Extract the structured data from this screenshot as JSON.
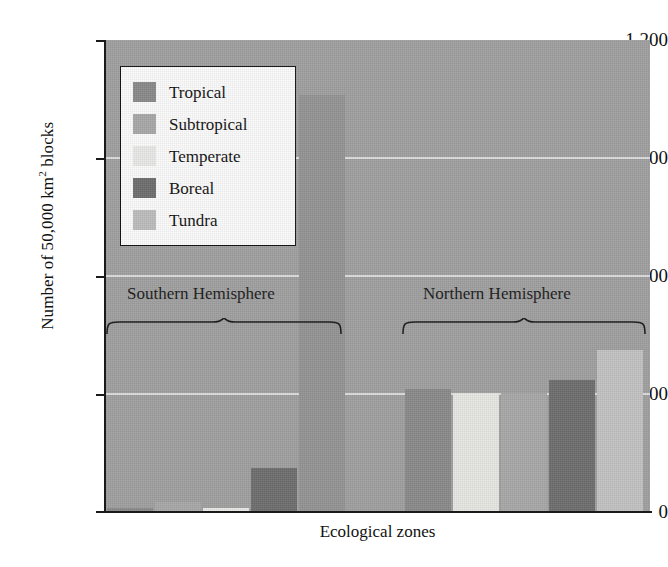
{
  "chart_data": {
    "type": "bar",
    "title": "",
    "xlabel": "Ecological zones",
    "ylabel": "Number of 50,000 km2 blocks",
    "ylabel_parts": {
      "pre": "Number of 50,000 km",
      "sup": "2",
      "post": " blocks"
    },
    "ylim": [
      0,
      1200
    ],
    "yticks": [
      0,
      300,
      600,
      900,
      1200
    ],
    "ytick_labels": [
      "0",
      "300",
      "600",
      "900",
      "1,200"
    ],
    "grid": "horizontal",
    "legend_position": "upper-left-inside",
    "categories": [
      "Tropical",
      "Subtropical",
      "Temperate",
      "Boreal",
      "Tundra"
    ],
    "groups": [
      "Southern Hemisphere",
      "Northern Hemisphere"
    ],
    "series": [
      {
        "name": "Southern Hemisphere",
        "values": [
          8,
          22,
          8,
          110,
          1060
        ]
      },
      {
        "name": "Northern Hemisphere",
        "values": [
          312,
          300,
          300,
          335,
          410
        ]
      }
    ],
    "colors": {
      "Tropical": "#8a8a8a",
      "Subtropical": "#a8a8a8",
      "Temperate": "#e8e8e6",
      "Boreal": "#6e6e6e",
      "Tundra": "#bdbdbd",
      "plot_background": "#a0a0a0",
      "gridline": "#e8e8e8",
      "axis": "#1a1a1a",
      "legend_background": "#fbfbfb"
    }
  },
  "legend": {
    "items": [
      {
        "label": "Tropical",
        "color": "#8a8a8a"
      },
      {
        "label": "Subtropical",
        "color": "#a8a8a8"
      },
      {
        "label": "Temperate",
        "color": "#e8e8e6"
      },
      {
        "label": "Boreal",
        "color": "#6e6e6e"
      },
      {
        "label": "Tundra",
        "color": "#bdbdbd"
      }
    ]
  },
  "axes": {
    "x_title": "Ecological zones",
    "y_tick_0": "0",
    "y_tick_300": "300",
    "y_tick_600": "600",
    "y_tick_900": "900",
    "y_tick_1200": "1,200"
  },
  "group_labels": {
    "southern": "Southern Hemisphere",
    "northern": "Northern Hemisphere"
  }
}
